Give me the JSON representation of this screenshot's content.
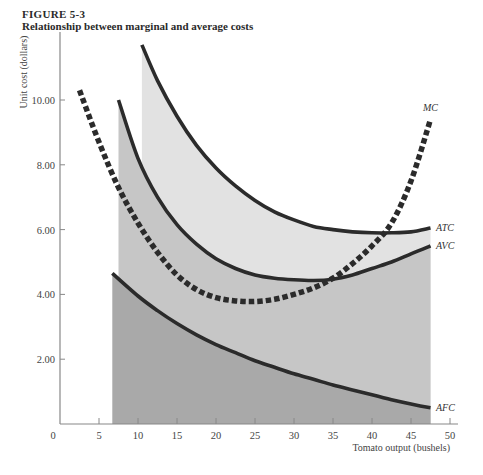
{
  "figure": {
    "number": "FIGURE 5-3",
    "title": "Relationship between marginal and average costs"
  },
  "colors": {
    "background": "#ffffff",
    "axis": "#888888",
    "curve": "#2b2b2b",
    "afc_fill": "#a9a9a9",
    "avc_band_fill": "#c6c6c6",
    "atc_band_fill": "#e2e2e2"
  },
  "chart_data": {
    "type": "line",
    "title": "Relationship between marginal and average costs",
    "xlabel": "Tomato output (bushels)",
    "ylabel": "Unit cost (dollars)",
    "xlim": [
      0,
      50
    ],
    "ylim": [
      0,
      12
    ],
    "x_ticks": [
      0,
      5,
      10,
      15,
      20,
      25,
      30,
      35,
      40,
      45,
      50
    ],
    "x_tick_labels": [
      "0",
      "5",
      "10",
      "15",
      "20",
      "25",
      "30",
      "35",
      "40",
      "45",
      "50"
    ],
    "y_ticks": [
      2,
      4,
      6,
      8,
      10
    ],
    "y_tick_labels": [
      "2.00",
      "4.00",
      "6.00",
      "8.00",
      "10.00"
    ],
    "grid": false,
    "legend": "inline labels at right end of curves",
    "series": [
      {
        "name": "MC",
        "style": "dashed",
        "x": [
          2.5,
          5,
          7.5,
          10,
          12.5,
          15,
          17.5,
          20,
          22.5,
          25,
          27.5,
          30,
          32.5,
          35,
          37.5,
          40,
          42.5,
          45,
          47.5
        ],
        "y": [
          10.3,
          8.7,
          7.3,
          6.2,
          5.3,
          4.6,
          4.15,
          3.9,
          3.8,
          3.78,
          3.85,
          4.0,
          4.2,
          4.5,
          4.95,
          5.5,
          6.2,
          7.5,
          9.4
        ]
      },
      {
        "name": "ATC",
        "style": "solid",
        "x": [
          10.5,
          12.5,
          15,
          17.5,
          20,
          22.5,
          25,
          27.5,
          30,
          32.5,
          35,
          37.5,
          40,
          42.5,
          45,
          47.5
        ],
        "y": [
          11.7,
          10.6,
          9.5,
          8.6,
          7.9,
          7.35,
          6.9,
          6.55,
          6.3,
          6.1,
          6.0,
          5.93,
          5.9,
          5.9,
          5.93,
          6.05
        ]
      },
      {
        "name": "AVC",
        "style": "solid",
        "x": [
          7.5,
          10,
          12.5,
          15,
          17.5,
          20,
          22.5,
          25,
          27.5,
          30,
          32.5,
          35,
          37.5,
          40,
          42.5,
          45,
          47.5
        ],
        "y": [
          10.0,
          8.2,
          7.0,
          6.15,
          5.55,
          5.1,
          4.8,
          4.6,
          4.5,
          4.45,
          4.43,
          4.47,
          4.6,
          4.8,
          5.0,
          5.25,
          5.5
        ]
      },
      {
        "name": "AFC",
        "style": "solid",
        "x": [
          6.7,
          10,
          12.5,
          15,
          17.5,
          20,
          22.5,
          25,
          27.5,
          30,
          32.5,
          35,
          37.5,
          40,
          42.5,
          45,
          47.5
        ],
        "y": [
          4.65,
          3.95,
          3.5,
          3.1,
          2.75,
          2.45,
          2.2,
          1.95,
          1.75,
          1.55,
          1.38,
          1.2,
          1.05,
          0.9,
          0.75,
          0.62,
          0.5
        ]
      }
    ],
    "shaded_regions": [
      {
        "name": "AFC area",
        "under": "AFC",
        "x_from": 6.7,
        "x_to": 47.5
      },
      {
        "name": "AVC band",
        "under": "AVC",
        "x_from": 7.5,
        "x_to": 47.5
      },
      {
        "name": "ATC band",
        "under": "ATC",
        "x_from": 10.5,
        "x_to": 47.5
      }
    ]
  }
}
